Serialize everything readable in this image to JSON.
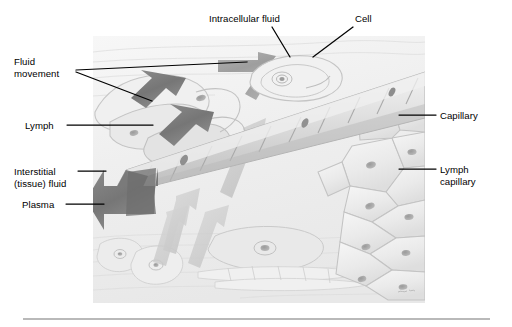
{
  "figure": {
    "type": "anatomical-illustration",
    "illustration_bounds": {
      "x": 93,
      "y": 36,
      "width": 332,
      "height": 267
    },
    "style": {
      "background": "#ffffff",
      "illustration_base": "#f3f3f3",
      "tissue_light": "#ededed",
      "tissue_mid": "#dcdcdc",
      "tissue_dark": "#c4c4c4",
      "arrow_dark": "#9a9a9a",
      "arrow_darker": "#6f6f6f",
      "arrow_light": "#c9c9c9",
      "outline": "#8e8e8e",
      "label_color": "#000000",
      "leader_color": "#000000",
      "rule_color": "#b9b9b9"
    }
  },
  "labels": [
    {
      "id": "intracellular-fluid",
      "lines": [
        "Intracellular fluid"
      ],
      "x": 209,
      "y": 13,
      "align": "left",
      "leader": [
        [
          272,
          27
        ],
        [
          290,
          57
        ]
      ]
    },
    {
      "id": "cell",
      "lines": [
        "Cell"
      ],
      "x": 355,
      "y": 13,
      "align": "left",
      "leader": [
        [
          353,
          27
        ],
        [
          313,
          57
        ]
      ]
    },
    {
      "id": "fluid-movement",
      "lines": [
        "Fluid",
        "movement"
      ],
      "x": 14,
      "y": 56,
      "align": "left",
      "leader": [
        [
          75,
          70
        ],
        [
          245,
          63
        ]
      ],
      "leader2": [
        [
          75,
          72
        ],
        [
          150,
          100
        ]
      ]
    },
    {
      "id": "lymph",
      "lines": [
        "Lymph"
      ],
      "x": 25,
      "y": 120,
      "align": "left",
      "leader": [
        [
          67,
          125
        ],
        [
          152,
          125
        ]
      ]
    },
    {
      "id": "interstitial-tissue-fluid",
      "lines": [
        "Interstitial",
        "(tissue) fluid"
      ],
      "x": 14,
      "y": 166,
      "align": "left",
      "leader": [
        [
          77,
          171
        ],
        [
          105,
          171
        ]
      ]
    },
    {
      "id": "plasma",
      "lines": [
        "Plasma"
      ],
      "x": 22,
      "y": 199,
      "align": "left",
      "leader": [
        [
          66,
          204
        ],
        [
          103,
          204
        ]
      ]
    },
    {
      "id": "capillary",
      "lines": [
        "Capillary"
      ],
      "x": 440,
      "y": 110,
      "align": "left",
      "leader": [
        [
          436,
          115
        ],
        [
          400,
          115
        ]
      ]
    },
    {
      "id": "lymph-capillary",
      "lines": [
        "Lymph",
        "capillary"
      ],
      "x": 440,
      "y": 164,
      "align": "left",
      "leader": [
        [
          436,
          169
        ],
        [
          400,
          169
        ]
      ]
    }
  ],
  "structures": [
    {
      "id": "blood-capillary",
      "description": "Segmented endothelial tube running diagonally from lower-left to upper-right"
    },
    {
      "id": "lymph-capillary-vessel",
      "description": "Open-ended lymphatic vessel at the left with overlapping endothelial flaps"
    },
    {
      "id": "tissue-cell",
      "description": "Oval tissue cell with concentric rings and central nucleus at upper center"
    },
    {
      "id": "tissue-background",
      "description": "Sheets of flattened tissue cells forming the background"
    },
    {
      "id": "lymph-endothelium",
      "description": "Large polygonal endothelial cells with nuclei at right forming lymph capillary wall"
    }
  ],
  "arrows": [
    {
      "id": "plasma-arrow",
      "tone": "dark",
      "direction": "left",
      "description": "Large dark arrow exiting open end of blood capillary"
    },
    {
      "id": "lymph-arrow-upper",
      "tone": "dark",
      "direction": "left-down",
      "description": "Dark arrow entering lymph capillary opening"
    },
    {
      "id": "lymph-arrow-lower",
      "tone": "dark",
      "direction": "left-down",
      "description": "Second dark arrow entering lymph capillary opening"
    },
    {
      "id": "fluid-movement-arrow-top",
      "tone": "mid",
      "direction": "left",
      "description": "Mid-tone arrow moving fluid toward the left past the cell"
    },
    {
      "id": "interstitial-arrow-down",
      "tone": "light",
      "direction": "down-right",
      "description": "Pale broad arrow of interstitial fluid flowing downward"
    },
    {
      "id": "interstitial-arrow-lower",
      "tone": "light",
      "direction": "down",
      "description": "Pale arrow flowing down from beneath the capillary"
    }
  ],
  "caption_rule": {
    "x": 23,
    "y": 318,
    "width": 467
  }
}
